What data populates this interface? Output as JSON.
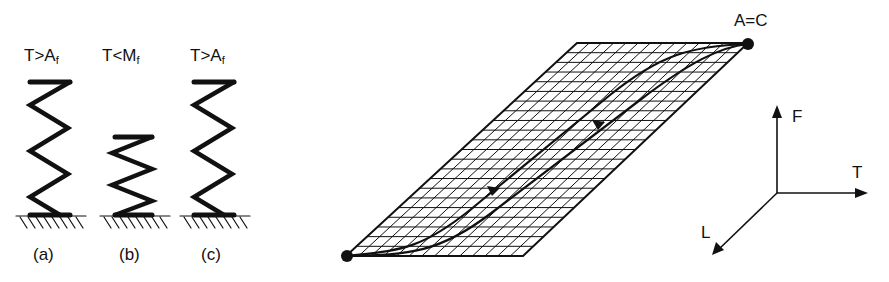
{
  "springs": [
    {
      "id": "a",
      "condition_main": "T>A",
      "condition_sub": "f",
      "caption": "(a)",
      "state": "extended"
    },
    {
      "id": "b",
      "condition_main": "T<M",
      "condition_sub": "f",
      "caption": "(b)",
      "state": "compressed"
    },
    {
      "id": "c",
      "condition_main": "T>A",
      "condition_sub": "f",
      "caption": "(c)",
      "state": "extended"
    }
  ],
  "surface": {
    "point_label": "A=C",
    "description": "gridded parallelogram surface with a hysteresis loop drawn from the bottom-left point to A=C, with arrows on both branches"
  },
  "axes": {
    "vertical": "F",
    "horizontal": "T",
    "depth": "L"
  },
  "colors": {
    "ink": "#111111",
    "background": "#ffffff"
  }
}
